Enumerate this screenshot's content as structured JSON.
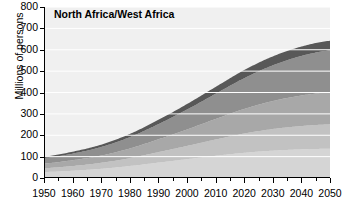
{
  "chart_data": {
    "type": "area",
    "stacked": true,
    "title": "North Africa/West Africa",
    "xlabel": "",
    "ylabel": "Millions of persons",
    "xlim": [
      1950,
      2050
    ],
    "ylim": [
      0,
      800
    ],
    "ytick_values": [
      0,
      100,
      200,
      300,
      400,
      500,
      600,
      700,
      800
    ],
    "ytick_labels": [
      "0",
      "100",
      "200",
      "300",
      "400",
      "500",
      "600",
      "700",
      "800"
    ],
    "xtick_values": [
      1950,
      1960,
      1970,
      1980,
      1990,
      2000,
      2010,
      2020,
      2030,
      2040,
      2050
    ],
    "xtick_labels": [
      "1950",
      "1960",
      "1970",
      "1980",
      "1990",
      "2000",
      "2010",
      "2020",
      "2030",
      "2040",
      "2050"
    ],
    "xtick_minor_step": 5,
    "grid": true,
    "grid_color": "#ffffff",
    "plot_background": "#f0f0f0",
    "legend": "none",
    "x": [
      1950,
      1960,
      1970,
      1980,
      1990,
      2000,
      2010,
      2020,
      2030,
      2040,
      2050
    ],
    "series": [
      {
        "name": "band-1",
        "color": "#d5d5d5",
        "values": [
          28,
          34,
          43,
          56,
          72,
          88,
          104,
          118,
          128,
          134,
          137
        ]
      },
      {
        "name": "band-2",
        "color": "#c2c2c2",
        "values": [
          18,
          22,
          28,
          37,
          49,
          62,
          76,
          90,
          101,
          109,
          114
        ]
      },
      {
        "name": "band-3",
        "color": "#a8a8a8",
        "values": [
          22,
          27,
          34,
          45,
          60,
          77,
          96,
          115,
          131,
          143,
          150
        ]
      },
      {
        "name": "band-4",
        "color": "#8f8f8f",
        "values": [
          25,
          31,
          40,
          53,
          71,
          93,
          118,
          144,
          167,
          185,
          196
        ]
      },
      {
        "name": "band-5",
        "color": "#585858",
        "values": [
          7,
          9,
          11,
          15,
          20,
          26,
          32,
          38,
          42,
          44,
          45
        ]
      }
    ],
    "totals": [
      100,
      123,
      156,
      206,
      272,
      346,
      426,
      505,
      569,
      615,
      642
    ]
  },
  "axis": {
    "y_title": "Millions of persons"
  }
}
